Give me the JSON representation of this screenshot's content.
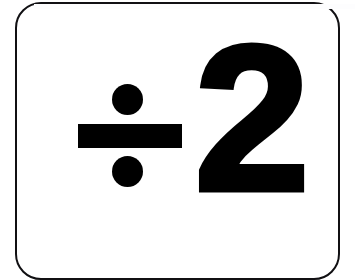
{
  "card": {
    "type": "math-flashcard",
    "background_color": "#ffffff",
    "border_color": "#111013",
    "corner_radius_px": 26
  },
  "content": {
    "expression": "÷2",
    "operator_symbol": "÷",
    "operator_name": "division-sign",
    "operand": "2",
    "ink_color": "#000000"
  },
  "page": {
    "background_color": "#ffffff"
  }
}
